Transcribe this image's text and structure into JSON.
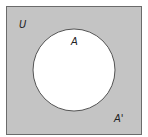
{
  "diagram": {
    "type": "venn",
    "universe_label": "U",
    "set_label": "A",
    "complement_label": "A'",
    "colors": {
      "universe_fill": "#c4c4c4",
      "universe_stroke": "#6b6b6b",
      "set_fill": "#ffffff",
      "set_stroke": "#555555",
      "label": "#222222"
    }
  }
}
